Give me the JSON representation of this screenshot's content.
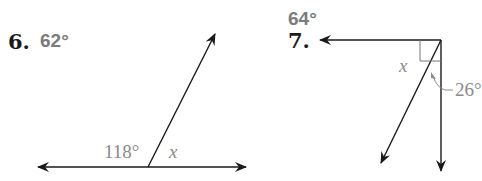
{
  "problems": [
    {
      "number": "6.",
      "answer": "62°",
      "figure": {
        "angle_labels": [
          "118°",
          "x"
        ],
        "description": "straight line with a ray forming a linear pair"
      }
    },
    {
      "number": "7.",
      "answer": "64°",
      "figure": {
        "angle_labels": [
          "x",
          "26°"
        ],
        "description": "right angle split by a ray into x and 26°"
      }
    }
  ],
  "colors": {
    "ink": "#1a1a1a",
    "answer_gray": "#7b7b7b",
    "label_gray": "#8a8a8a"
  }
}
